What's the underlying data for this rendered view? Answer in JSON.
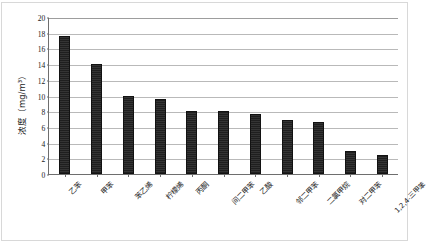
{
  "chart_data": {
    "type": "bar",
    "title": "",
    "subtitle": "",
    "xlabel": "",
    "ylabel": "浓度（mg/m³）",
    "ylim": [
      0,
      20
    ],
    "ytick_step": 2,
    "yticks": [
      "20",
      "18",
      "16",
      "14",
      "12",
      "10",
      "8",
      "6",
      "4",
      "2",
      "0"
    ],
    "grid": true,
    "legend": false,
    "legend_position": "none",
    "bar_color": "#262626",
    "gridline_color": "#b9b9b9",
    "axis_color": "#6e6e6e",
    "categories": [
      "乙苯",
      "甲苯",
      "苯乙烯",
      "柠檬烯",
      "丙酮",
      "间二甲苯",
      "乙酸",
      "邻二甲苯",
      "二氯甲烷",
      "对二甲苯",
      "1,2,4-三甲苯"
    ],
    "values": [
      17.6,
      14.0,
      9.9,
      9.5,
      8.0,
      8.0,
      7.6,
      6.85,
      6.6,
      2.95,
      2.4
    ]
  }
}
